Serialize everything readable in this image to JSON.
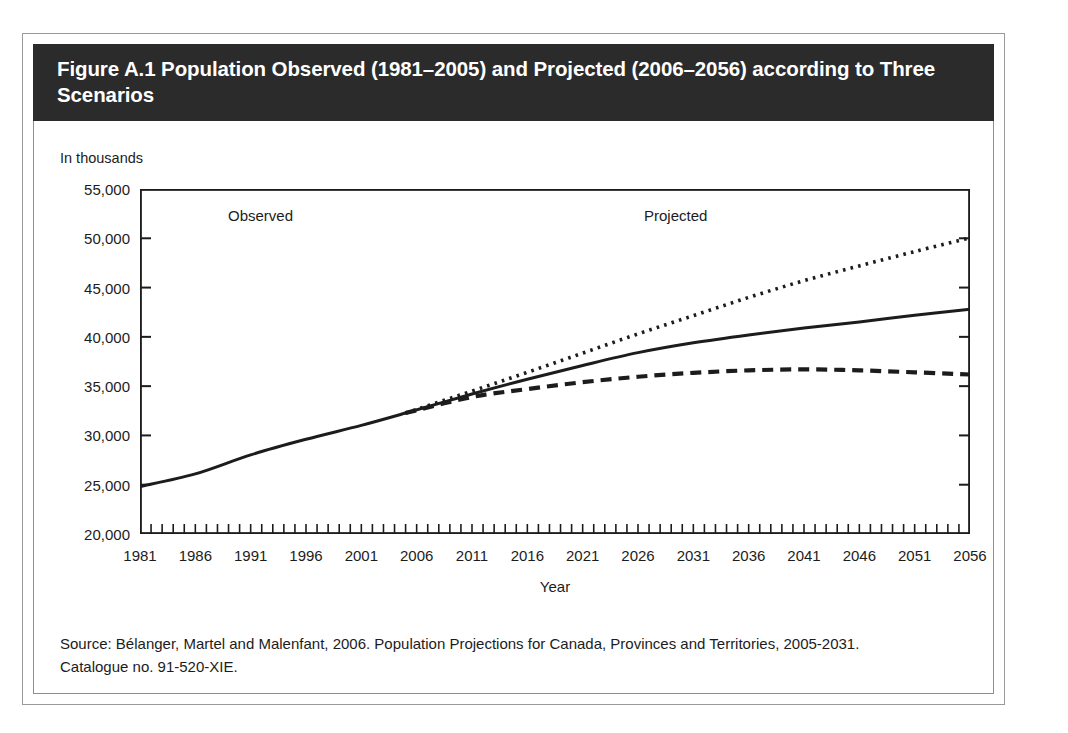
{
  "figure": {
    "title": "Figure A.1 Population Observed (1981–2005) and Projected (2006–2056) according to Three Scenarios",
    "units_label": "In thousands",
    "source_line_1": "Source: Bélanger, Martel and Malenfant, 2006. Population Projections for Canada, Provinces and Territories, 2005-2031.",
    "source_line_2": "Catalogue no. 91-520-XIE.",
    "banner_color": "#2b2b2b",
    "line_color": "#1c1c1c",
    "frame_color": "#8f8f8f"
  },
  "annotations": {
    "observed": "Observed",
    "projected": "Projected"
  },
  "chart_data": {
    "type": "line",
    "title": "Figure A.1 Population Observed (1981–2005) and Projected (2006–2056) according to Three Scenarios",
    "xlabel": "Year",
    "ylabel": "In thousands",
    "xlim": [
      1981,
      2056
    ],
    "ylim": [
      20000,
      55000
    ],
    "ytick_values": [
      20000,
      25000,
      30000,
      35000,
      40000,
      45000,
      50000,
      55000
    ],
    "ytick_labels": [
      "20,000",
      "25,000",
      "30,000",
      "35,000",
      "40,000",
      "45,000",
      "50,000",
      "55,000"
    ],
    "xtick_labels": [
      "1981",
      "1986",
      "1991",
      "1996",
      "2001",
      "2006",
      "2011",
      "2016",
      "2021",
      "2026",
      "2031",
      "2036",
      "2041",
      "2046",
      "2051",
      "2056"
    ],
    "xtick_values": [
      1981,
      1986,
      1991,
      1996,
      2001,
      2006,
      2011,
      2016,
      2021,
      2026,
      2031,
      2036,
      2041,
      2046,
      2051,
      2056
    ],
    "minor_tick_interval": 1,
    "grid": false,
    "legend": "none",
    "observed_range": [
      1981,
      2005
    ],
    "projected_range": [
      2006,
      2056
    ],
    "series": [
      {
        "name": "Observed",
        "style": "solid",
        "x": [
          1981,
          1986,
          1991,
          1996,
          2001,
          2005
        ],
        "values": [
          24820,
          26100,
          28030,
          29610,
          31020,
          32270
        ]
      },
      {
        "name": "High growth scenario",
        "style": "dotted",
        "x": [
          2005,
          2011,
          2016,
          2021,
          2026,
          2031,
          2036,
          2041,
          2046,
          2051,
          2056
        ],
        "values": [
          32270,
          34500,
          36400,
          38350,
          40300,
          42150,
          44000,
          45700,
          47200,
          48650,
          50050
        ]
      },
      {
        "name": "Medium growth scenario",
        "style": "solid",
        "x": [
          2005,
          2011,
          2016,
          2021,
          2026,
          2031,
          2036,
          2041,
          2046,
          2051,
          2056
        ],
        "values": [
          32270,
          34200,
          35700,
          37100,
          38400,
          39400,
          40200,
          40900,
          41500,
          42200,
          42800
        ]
      },
      {
        "name": "Low growth scenario",
        "style": "dashed",
        "x": [
          2005,
          2011,
          2016,
          2021,
          2026,
          2031,
          2036,
          2041,
          2046,
          2051,
          2056
        ],
        "values": [
          32270,
          33900,
          34700,
          35400,
          35950,
          36350,
          36600,
          36700,
          36600,
          36400,
          36180
        ]
      }
    ]
  }
}
